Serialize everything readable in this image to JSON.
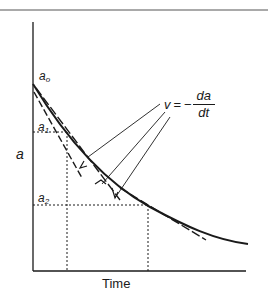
{
  "figure": {
    "type": "diagram",
    "y_axis_label": "a",
    "x_axis_label": "Time",
    "levels": {
      "a0": {
        "base": "a",
        "sub": "o"
      },
      "a1": {
        "base": "a",
        "sub": "1"
      },
      "a2": {
        "base": "a",
        "sub": "2"
      }
    },
    "rate_equation": {
      "lhs": "v",
      "equals": "=",
      "minus": "−",
      "numerator": "da",
      "denominator": "dt"
    },
    "arrow_label": "V",
    "colors": {
      "ink": "#1a1a1a",
      "background": "#ffffff",
      "frame": "#555555"
    }
  }
}
